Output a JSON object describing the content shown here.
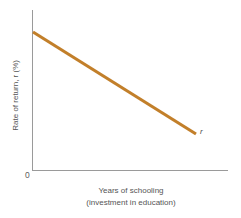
{
  "figure": {
    "background_color": "#ffffff",
    "axis_color": "#9a9a9a",
    "text_color": "#555555"
  },
  "axes": {
    "y_title": "Rate of return, r (%)",
    "x_title_line1": "Years of schooling",
    "x_title_line2": "(investment in education)",
    "origin_label": "0"
  },
  "curve": {
    "label": "r",
    "color": "#c27f2a"
  },
  "chart_data": {
    "type": "line",
    "title": "",
    "xlabel": "Years of schooling (investment in education)",
    "ylabel": "Rate of return, r (%)",
    "xlim": [
      0,
      100
    ],
    "ylim": [
      0,
      100
    ],
    "grid": false,
    "legend": "none",
    "annotations": [
      {
        "text": "r",
        "x": 100,
        "y": 26,
        "style": "italic"
      },
      {
        "text": "0",
        "x": 0,
        "y": 0,
        "style": "origin"
      }
    ],
    "series": [
      {
        "name": "r",
        "color": "#c27f2a",
        "x": [
          0,
          100
        ],
        "values": [
          100,
          26
        ],
        "description": "Rate of return declines linearly as years of schooling increase"
      }
    ]
  }
}
